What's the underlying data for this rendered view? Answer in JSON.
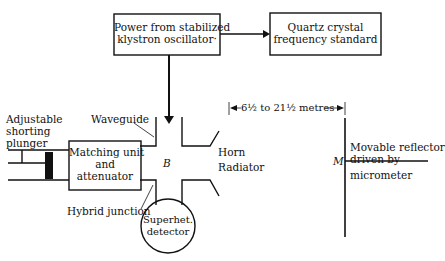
{
  "diagram": {
    "boxes": {
      "klystron": [
        "Power from stabilized",
        "klystron oscillator·"
      ],
      "quartz": [
        "Quartz crystal",
        "frequency standard"
      ],
      "matching": [
        "Matching unit",
        "and",
        "attenuator"
      ],
      "detector": [
        "Superhet.",
        "detector"
      ]
    },
    "labels": {
      "plunger": [
        "Adjustable",
        "shorting",
        "plunger"
      ],
      "waveguide": "Waveguide",
      "hybrid": "Hybrid junction",
      "junction_letter": "B",
      "horn": [
        "Horn",
        "Radiator"
      ],
      "distance": "6½ to 21½ metres",
      "reflector_letter": "M",
      "reflector": [
        "Movable reflector",
        "driven by",
        "micrometer"
      ]
    }
  }
}
